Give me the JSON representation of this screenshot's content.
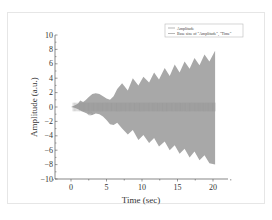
{
  "chart_data": {
    "type": "area",
    "title": "",
    "xlabel": "Time (sec)",
    "ylabel": "Amplitude (a.u.)",
    "xlim": [
      -3,
      22
    ],
    "ylim": [
      -10,
      10
    ],
    "x_ticks": [
      0,
      5,
      10,
      15,
      20
    ],
    "x_tick_labels": [
      "0",
      "5",
      "10",
      "15",
      "20"
    ],
    "y_ticks": [
      10,
      8,
      6,
      4,
      2,
      0,
      -2,
      -4,
      -6,
      -8,
      -10
    ],
    "y_tick_labels": [
      "10",
      "8",
      "6",
      "4",
      "2",
      "0",
      "-2",
      "-4",
      "-6",
      "-8",
      "-10"
    ],
    "grid": false,
    "legend_position": "top-right",
    "legend": [
      "Amplitude",
      "Base sine of \"Amplitude\", \"Time\""
    ],
    "series": [
      {
        "name": "Amplitude (upper envelope)",
        "x": [
          0,
          0.5,
          1,
          1.3,
          1.7,
          2,
          2.5,
          3,
          3.5,
          4,
          4.5,
          5,
          5.5,
          6,
          6.5,
          7.2,
          8,
          8.7,
          9.5,
          10.2,
          11,
          11.7,
          12.4,
          13.2,
          13.9,
          14.6,
          15.3,
          16,
          16.7,
          17.4,
          18.1,
          18.8,
          19.5,
          20.3
        ],
        "values": [
          0,
          0.2,
          0.5,
          0.9,
          0.7,
          0.9,
          1.4,
          1.8,
          1.9,
          1.8,
          1.5,
          1.2,
          1.0,
          1.5,
          2.5,
          3.3,
          2.3,
          4.0,
          3.0,
          4.2,
          3.4,
          4.8,
          3.8,
          5.4,
          4.3,
          5.9,
          4.8,
          6.3,
          5.3,
          6.8,
          5.8,
          7.3,
          6.3,
          7.8
        ]
      },
      {
        "name": "Amplitude (lower envelope)",
        "x": [
          0,
          0.5,
          1,
          1.5,
          2,
          2.5,
          3,
          3.5,
          4,
          4.5,
          5,
          5.5,
          6,
          6.5,
          7.2,
          8,
          8.7,
          9.5,
          10.2,
          11,
          11.7,
          12.4,
          13.2,
          13.9,
          14.6,
          15.3,
          16,
          16.7,
          17.4,
          18.1,
          18.8,
          19.5,
          20.3
        ],
        "values": [
          0,
          -0.1,
          -0.3,
          -0.6,
          -0.8,
          -1.0,
          -1.1,
          -0.9,
          -1.0,
          -1.3,
          -1.8,
          -2.4,
          -2.5,
          -2.2,
          -3.0,
          -3.8,
          -3.2,
          -4.6,
          -3.9,
          -5.0,
          -4.3,
          -5.5,
          -4.8,
          -6.0,
          -5.3,
          -6.5,
          -5.8,
          -7.0,
          -6.2,
          -7.4,
          -6.7,
          -7.8,
          -8.0
        ]
      }
    ]
  },
  "legend": {
    "items": [
      {
        "label": "Amplitude"
      },
      {
        "label": "Base sine of \"Amplitude\", \"Time\""
      }
    ]
  },
  "axes": {
    "xlabel": "Time (sec)",
    "ylabel": "Amplitude (a.u.)"
  },
  "colors": {
    "fill": "#9e9e9e",
    "axis": "#555555",
    "text": "#333333"
  }
}
